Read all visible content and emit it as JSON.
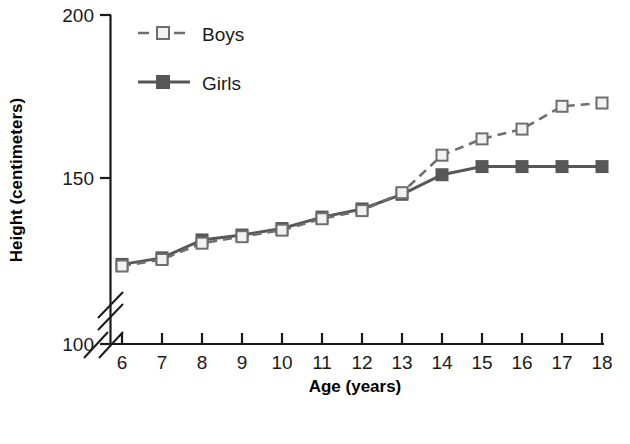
{
  "chart_data": {
    "type": "line",
    "title": "",
    "xlabel": "Age (years)",
    "ylabel": "Height (centimeters)",
    "x": [
      6,
      7,
      8,
      9,
      10,
      11,
      12,
      13,
      14,
      15,
      16,
      17,
      18
    ],
    "xtick_labels": [
      "6",
      "7",
      "8",
      "9",
      "10",
      "11",
      "12",
      "13",
      "14",
      "15",
      "16",
      "17",
      "18"
    ],
    "ytick_labels": [
      "100",
      "150",
      "200"
    ],
    "yticks": [
      100,
      150,
      200
    ],
    "ylim": [
      100,
      200
    ],
    "xlim": [
      6,
      18
    ],
    "grid": false,
    "axis_break_y": true,
    "axis_break_x": true,
    "legend_position": "upper-left-inside",
    "series": [
      {
        "name": "Boys",
        "marker": "open-square",
        "line_style": "dashed",
        "color": "#6e6e6e",
        "marker_fill": "#f2f2f2",
        "values": [
          123.0,
          125.0,
          130.0,
          132.0,
          134.0,
          137.5,
          140.0,
          145.5,
          157.0,
          162.0,
          165.0,
          172.0,
          173.0
        ]
      },
      {
        "name": "Girls",
        "marker": "filled-square",
        "line_style": "solid",
        "color": "#575757",
        "marker_fill": "#575757",
        "values": [
          123.5,
          125.5,
          131.0,
          132.5,
          134.5,
          138.0,
          140.5,
          145.0,
          151.0,
          153.5,
          153.5,
          153.5,
          153.5
        ]
      }
    ]
  },
  "legend": {
    "items": [
      {
        "label": "Boys"
      },
      {
        "label": "Girls"
      }
    ]
  },
  "axes": {
    "y_title": "Height (centimeters)",
    "x_title": "Age (years)"
  },
  "colors": {
    "boys": "#6e6e6e",
    "girls": "#575757",
    "axis": "#1a1a1a",
    "background": "#ffffff"
  }
}
